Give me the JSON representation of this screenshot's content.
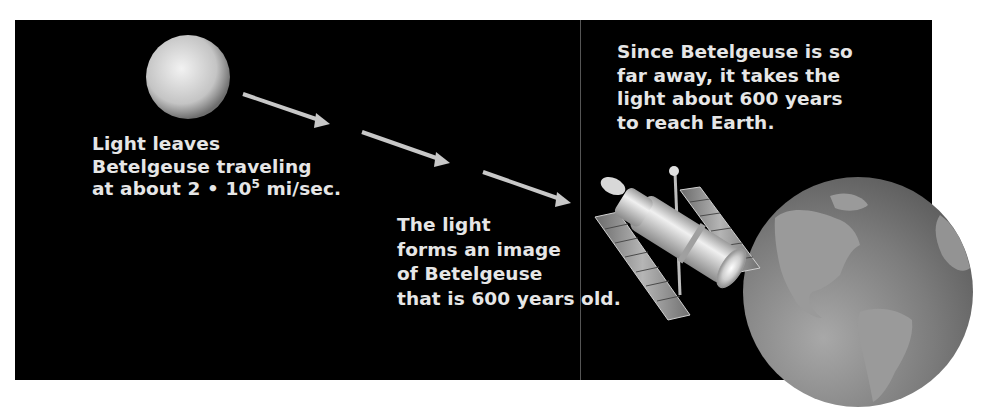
{
  "diagram": {
    "background_color": "#000000",
    "text_color": "#e6e6e6",
    "nodes": [
      {
        "id": "betelgeuse",
        "icon": "star-icon",
        "label": "Betelgeuse"
      },
      {
        "id": "telescope",
        "icon": "space-telescope-icon",
        "label": "Space telescope"
      },
      {
        "id": "earth",
        "icon": "earth-globe-icon",
        "label": "Earth"
      }
    ],
    "arrows": [
      {
        "from": [
          243,
          94
        ],
        "to": [
          330,
          124
        ]
      },
      {
        "from": [
          362,
          132
        ],
        "to": [
          450,
          163
        ]
      },
      {
        "from": [
          483,
          172
        ],
        "to": [
          571,
          203
        ]
      }
    ],
    "captions": {
      "leaves": {
        "line1": "Light leaves",
        "line2": "Betelgeuse traveling",
        "line3_prefix": "at about 2 • 10",
        "line3_exp": "5",
        "line3_suffix": " mi/sec."
      },
      "image": {
        "line1": "The light",
        "line2": "forms an image",
        "line3": "of Betelgeuse",
        "line4": "that is 600 years old."
      },
      "distance": {
        "line1": "Since Betelgeuse is so",
        "line2": "far away, it takes the",
        "line3": "light about 600 years",
        "line4": "to reach Earth."
      }
    }
  }
}
